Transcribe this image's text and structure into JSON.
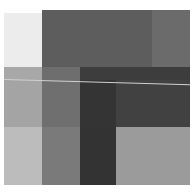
{
  "image": {
    "description": "Abstract grayscale composition of overlapping rectangles",
    "background": "#ffffff",
    "blocks": [
      {
        "name": "top-left-light",
        "x": 4,
        "y": 13,
        "w": 38,
        "h": 54,
        "color": "#ececec"
      },
      {
        "name": "top-mid-gray",
        "x": 42,
        "y": 10,
        "w": 110,
        "h": 57,
        "color": "#5d5d5d"
      },
      {
        "name": "top-right-gray",
        "x": 152,
        "y": 10,
        "w": 38,
        "h": 57,
        "color": "#6b6b6b"
      },
      {
        "name": "band2-left",
        "x": 4,
        "y": 67,
        "w": 38,
        "h": 13,
        "color": "#a8a8a8"
      },
      {
        "name": "band2-col2",
        "x": 42,
        "y": 67,
        "w": 38,
        "h": 13,
        "color": "#6e6e6e"
      },
      {
        "name": "band2-dark",
        "x": 80,
        "y": 67,
        "w": 110,
        "h": 13,
        "color": "#3d3d3d"
      },
      {
        "name": "band3-left",
        "x": 4,
        "y": 80,
        "w": 38,
        "h": 47,
        "color": "#a4a4a4"
      },
      {
        "name": "band3-col2",
        "x": 42,
        "y": 80,
        "w": 38,
        "h": 47,
        "color": "#6f6f6f"
      },
      {
        "name": "band3-col3",
        "x": 80,
        "y": 80,
        "w": 36,
        "h": 47,
        "color": "#343434"
      },
      {
        "name": "band3-right",
        "x": 116,
        "y": 80,
        "w": 74,
        "h": 47,
        "color": "#414141"
      },
      {
        "name": "bottom-left",
        "x": 4,
        "y": 127,
        "w": 38,
        "h": 58,
        "color": "#bcbcbc"
      },
      {
        "name": "bottom-col2",
        "x": 42,
        "y": 127,
        "w": 38,
        "h": 58,
        "color": "#7a7a7a"
      },
      {
        "name": "bottom-col3",
        "x": 80,
        "y": 127,
        "w": 36,
        "h": 58,
        "color": "#333333"
      },
      {
        "name": "bottom-right-light",
        "x": 116,
        "y": 127,
        "w": 74,
        "h": 58,
        "color": "#9b9b9b"
      }
    ],
    "lines": [
      {
        "name": "thin-highlight-line",
        "x": 4,
        "y": 79,
        "length": 186,
        "angle_deg": 1.6,
        "color": "#d0d0d0"
      }
    ]
  }
}
